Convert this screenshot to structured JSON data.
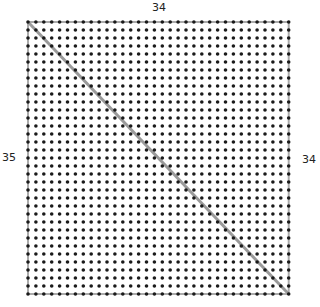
{
  "diagram": {
    "labels": {
      "top": "34",
      "left": "35",
      "right": "34"
    },
    "grid": {
      "columns": 34,
      "rows": 35,
      "origin_x": 28,
      "origin_y": 22,
      "spacing_x": 7.9,
      "spacing_y": 8.0,
      "dot_color": "#1a1a1a",
      "dot_radius": 1.8
    },
    "diagonal": {
      "from": "top-left",
      "to": "bottom-right",
      "color": "#9a9a9a"
    },
    "border_color": "#aaaaaa"
  }
}
